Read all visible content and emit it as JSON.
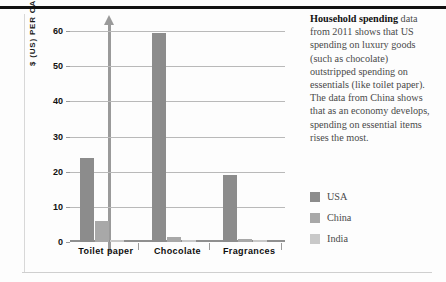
{
  "chart_data": {
    "type": "bar",
    "title": "",
    "xlabel": "",
    "ylabel": "$ (US) PER CAPITA, 2011",
    "ylim": [
      0,
      62
    ],
    "yticks": [
      0,
      10,
      20,
      30,
      40,
      50,
      60
    ],
    "ytick_labels": [
      "0",
      "10",
      "20",
      "30",
      "40",
      "50",
      "60"
    ],
    "grid": true,
    "legend_position": "right",
    "categories": [
      "Toilet paper",
      "Chocolate",
      "Fragrances"
    ],
    "series": [
      {
        "name": "USA",
        "color": "#8c8c8c",
        "values": [
          24,
          59.5,
          19
        ]
      },
      {
        "name": "China",
        "color": "#a8a8a8",
        "values": [
          6,
          1.3,
          0.8
        ]
      },
      {
        "name": "India",
        "color": "#c9c9c9",
        "values": [
          0.7,
          0.6,
          0.5
        ]
      }
    ]
  },
  "caption": {
    "lead": "Household spending",
    "body": " data from 2011 shows that US spending on luxury goods (such as chocolate) outstripped spending on essentials (like toilet paper). The data from China shows that as an economy develops, spending on essential items rises the most."
  },
  "legend": {
    "items": [
      {
        "label": "USA",
        "color": "#8c8c8c"
      },
      {
        "label": "China",
        "color": "#a8a8a8"
      },
      {
        "label": "India",
        "color": "#c9c9c9"
      }
    ]
  }
}
